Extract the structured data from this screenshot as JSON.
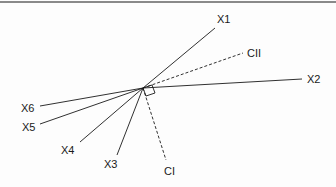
{
  "diagram": {
    "type": "vector-biplot",
    "origin": {
      "x": 143,
      "y": 88
    },
    "right_angle_marker": true,
    "vectors": [
      {
        "id": "X1",
        "label": "X1",
        "style": "solid",
        "end": {
          "x": 215,
          "y": 28
        },
        "label_pos": {
          "x": 217,
          "y": 23
        }
      },
      {
        "id": "X2",
        "label": "X2",
        "style": "solid",
        "end": {
          "x": 302,
          "y": 79
        },
        "label_pos": {
          "x": 307,
          "y": 83
        }
      },
      {
        "id": "X3",
        "label": "X3",
        "style": "solid",
        "end": {
          "x": 117,
          "y": 155
        },
        "label_pos": {
          "x": 104,
          "y": 168
        }
      },
      {
        "id": "X4",
        "label": "X4",
        "style": "solid",
        "end": {
          "x": 80,
          "y": 142
        },
        "label_pos": {
          "x": 61,
          "y": 154
        }
      },
      {
        "id": "X5",
        "label": "X5",
        "style": "solid",
        "end": {
          "x": 40,
          "y": 124
        },
        "label_pos": {
          "x": 22,
          "y": 131
        }
      },
      {
        "id": "X6",
        "label": "X6",
        "style": "solid",
        "end": {
          "x": 40,
          "y": 106
        },
        "label_pos": {
          "x": 21,
          "y": 112
        }
      },
      {
        "id": "CI",
        "label": "CI",
        "style": "dashed",
        "end": {
          "x": 166,
          "y": 160
        },
        "label_pos": {
          "x": 164,
          "y": 175
        }
      },
      {
        "id": "CII",
        "label": "CII",
        "style": "dashed",
        "end": {
          "x": 243,
          "y": 53
        },
        "label_pos": {
          "x": 247,
          "y": 57
        }
      }
    ],
    "colors": {
      "line": "#1a1a1a",
      "border": "#8a8a8a",
      "background": "#fdfdfd"
    }
  }
}
